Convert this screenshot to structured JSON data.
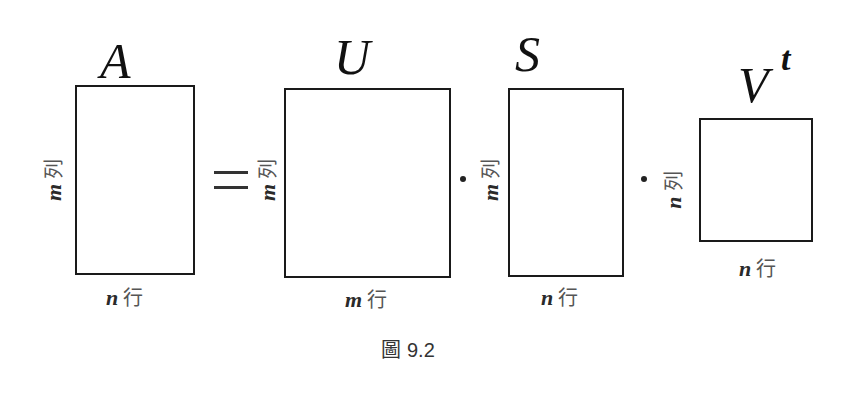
{
  "figure": {
    "caption_prefix": "圖",
    "caption_number": "9.2",
    "equals_sign": "=",
    "multiply_sign": "·"
  },
  "matrices": [
    {
      "name": "A",
      "sup": "",
      "row_var": "m",
      "row_unit": "列",
      "col_var": "n",
      "col_unit": "行"
    },
    {
      "name": "U",
      "sup": "",
      "row_var": "m",
      "row_unit": "列",
      "col_var": "m",
      "col_unit": "行"
    },
    {
      "name": "S",
      "sup": "",
      "row_var": "m",
      "row_unit": "列",
      "col_var": "n",
      "col_unit": "行"
    },
    {
      "name": "V",
      "sup": "t",
      "row_var": "n",
      "row_unit": "列",
      "col_var": "n",
      "col_unit": "行"
    }
  ],
  "colors": {
    "stroke": "#1a1a1a",
    "text": "#111111",
    "cjk_text": "#555555",
    "background": "#ffffff"
  }
}
